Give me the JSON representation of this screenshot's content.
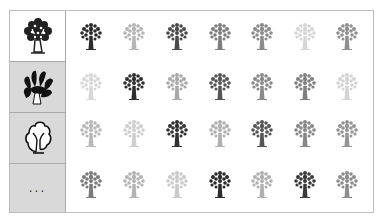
{
  "categories": [
    {
      "name": "leafy-tree",
      "selected": true
    },
    {
      "name": "bushy-tree",
      "selected": false
    },
    {
      "name": "outline-tree",
      "selected": false
    },
    {
      "name": "more",
      "label": "..."
    }
  ],
  "grid": {
    "columns": 7,
    "rows": 4,
    "icon": "leafy-tree-icon",
    "shades": [
      [
        "#2b2b2b",
        "#b5b5b5",
        "#4a4a4a",
        "#7d7d7d",
        "#8a8a8a",
        "#d6d6d6",
        "#8f8f8f"
      ],
      [
        "#d8d8d8",
        "#2e2e2e",
        "#a8a8a8",
        "#555555",
        "#8a8a8a",
        "#7f7f7f",
        "#d4d4d4"
      ],
      [
        "#b8b8b8",
        "#cfcfcf",
        "#303030",
        "#b0b0b0",
        "#555555",
        "#878787",
        "#959595"
      ],
      [
        "#7a7a7a",
        "#b3b3b3",
        "#cacaca",
        "#2c2c2c",
        "#b0b0b0",
        "#3a3a3a",
        "#8c8c8c"
      ]
    ]
  }
}
